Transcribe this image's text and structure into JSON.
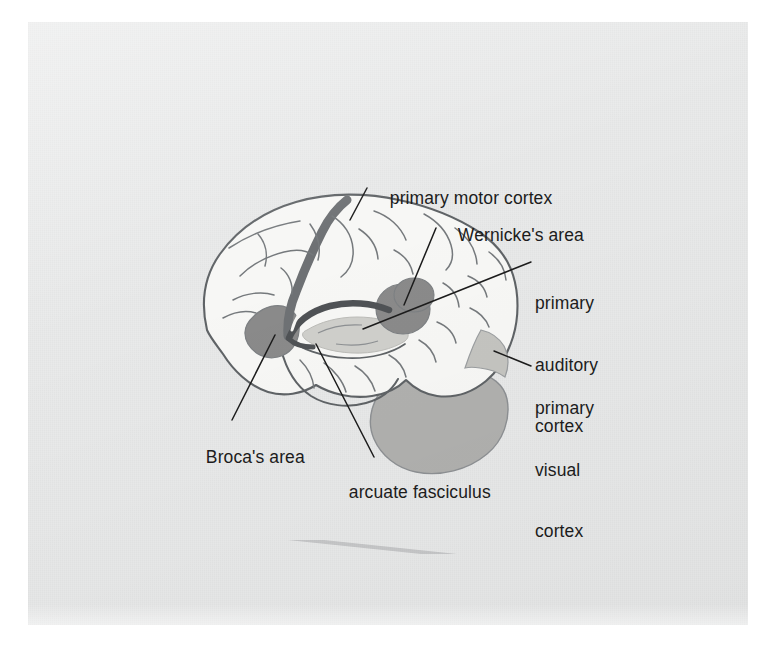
{
  "figure": {
    "kind": "anatomical-diagram",
    "background_color": "#e9eaea",
    "page_color": "#ffffff"
  },
  "palette": {
    "outline": "#5f6366",
    "sulci": "#75797c",
    "brain_fill": "#f7f7f5",
    "dark_region": "#8a8a8a",
    "arcuate_band": "#6e7174",
    "auditory_region": "#cfcfcb",
    "cerebellum": "#b0b0ae",
    "visual_strip": "#c4c4c0",
    "label_text": "#1c1c1c",
    "leader_line": "#1c1c1c"
  },
  "labels": [
    {
      "id": "primary-motor-cortex",
      "lines": [
        "primary motor cortex"
      ]
    },
    {
      "id": "wernickes-area",
      "lines": [
        "Wernicke's area"
      ]
    },
    {
      "id": "primary-auditory-cortex",
      "lines": [
        "primary",
        "auditory",
        "cortex"
      ]
    },
    {
      "id": "primary-visual-cortex",
      "lines": [
        "primary",
        "visual",
        "cortex"
      ]
    },
    {
      "id": "brocas-area",
      "lines": [
        "Broca's area"
      ]
    },
    {
      "id": "arcuate-fasciculus",
      "lines": [
        "arcuate fasciculus"
      ]
    }
  ],
  "label_text": {
    "primary_motor_cortex": "primary motor cortex",
    "wernickes_area": "Wernicke's area",
    "primary_auditory_cortex_l1": "primary",
    "primary_auditory_cortex_l2": "auditory",
    "primary_auditory_cortex_l3": "cortex",
    "primary_visual_cortex_l1": "primary",
    "primary_visual_cortex_l2": "visual",
    "primary_visual_cortex_l3": "cortex",
    "brocas_area": "Broca's area",
    "arcuate_fasciculus": "arcuate fasciculus"
  }
}
